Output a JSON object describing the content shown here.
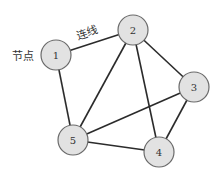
{
  "annotations": {
    "node_label": "节点",
    "edge_label": "连线"
  },
  "colors": {
    "node_fill": "#e2e2e2",
    "node_stroke": "#6a6a6a",
    "edge": "#2b2b2b"
  },
  "nodes": [
    {
      "id": "1",
      "x": 56,
      "y": 55,
      "r": 15
    },
    {
      "id": "2",
      "x": 133,
      "y": 30,
      "r": 15
    },
    {
      "id": "3",
      "x": 194,
      "y": 87,
      "r": 15
    },
    {
      "id": "4",
      "x": 159,
      "y": 152,
      "r": 15
    },
    {
      "id": "5",
      "x": 73,
      "y": 140,
      "r": 15
    }
  ],
  "edges": [
    [
      "1",
      "2"
    ],
    [
      "1",
      "5"
    ],
    [
      "2",
      "5"
    ],
    [
      "2",
      "4"
    ],
    [
      "2",
      "3"
    ],
    [
      "3",
      "5"
    ],
    [
      "3",
      "4"
    ],
    [
      "5",
      "4"
    ]
  ]
}
